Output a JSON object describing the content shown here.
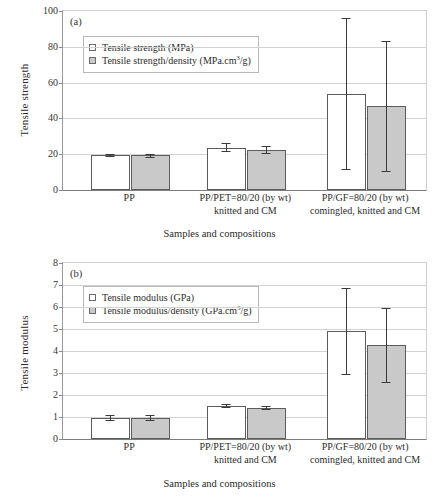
{
  "figure": {
    "xlabel": "Samples and compositions",
    "categories": [
      {
        "line1": "PP",
        "line2": ""
      },
      {
        "line1": "PP/PET=80/20 (by wt)",
        "line2": "knitted and CM"
      },
      {
        "line1": "PP/GF=80/20 (by wt)",
        "line2": "comingled, knitted and CM"
      }
    ],
    "colors": {
      "bar_open": "#ffffff",
      "bar_fill": "#c9c9c9",
      "outline": "#5c5c5c",
      "grid": "#d2d2d2"
    }
  },
  "chart_data": [
    {
      "type": "bar",
      "panel": "(a)",
      "title": "",
      "xlabel": "Samples and compositions",
      "ylabel": "Tensile strength",
      "ylim": [
        0,
        100
      ],
      "yticks": [
        0,
        20,
        40,
        60,
        80,
        100
      ],
      "grid": true,
      "legend_position": "upper left",
      "categories": [
        "PP",
        "PP/PET=80/20 (by wt) knitted and CM",
        "PP/GF=80/20 (by wt) comingled, knitted and CM"
      ],
      "series": [
        {
          "name": "Tensile strength (MPa)",
          "style": "open",
          "values": [
            19.5,
            23.6,
            53.5
          ],
          "err_low": [
            19.0,
            21.6,
            12.0
          ],
          "err_high": [
            20.0,
            26.3,
            96.0
          ]
        },
        {
          "name": "Tensile strength/density (MPa.cm3/g)",
          "style": "filled",
          "values": [
            19.5,
            22.5,
            47.0
          ],
          "err_low": [
            18.7,
            20.6,
            10.5
          ],
          "err_high": [
            20.3,
            24.4,
            83.0
          ]
        }
      ]
    },
    {
      "type": "bar",
      "panel": "(b)",
      "title": "",
      "xlabel": "Samples and compositions",
      "ylabel": "Tensile modulus",
      "ylim": [
        0,
        8
      ],
      "yticks": [
        0,
        1,
        2,
        3,
        4,
        5,
        6,
        7,
        8
      ],
      "grid": true,
      "legend_position": "upper left",
      "categories": [
        "PP",
        "PP/PET=80/20 (by wt) knitted and CM",
        "PP/GF=80/20 (by wt) comingled, knitted and CM"
      ],
      "series": [
        {
          "name": "Tensile modulus (GPa)",
          "style": "open",
          "values": [
            0.97,
            1.5,
            4.9
          ],
          "err_low": [
            0.88,
            1.44,
            2.95
          ],
          "err_high": [
            1.08,
            1.57,
            6.85
          ]
        },
        {
          "name": "Tensile modulus/density (GPa.cm3/g)",
          "style": "filled",
          "values": [
            0.97,
            1.42,
            4.27
          ],
          "err_low": [
            0.85,
            1.35,
            2.6
          ],
          "err_high": [
            1.1,
            1.49,
            5.95
          ]
        }
      ]
    }
  ],
  "legends": {
    "a": [
      {
        "label_pre": "Tensile strength (MPa)",
        "sup": "",
        "label_post": "",
        "style": "open"
      },
      {
        "label_pre": "Tensile strength/density (MPa.cm",
        "sup": "3",
        "label_post": "/g)",
        "style": "filled"
      }
    ],
    "b": [
      {
        "label_pre": "Tensile modulus (GPa)",
        "sup": "",
        "label_post": "",
        "style": "open"
      },
      {
        "label_pre": "Tensile modulus/density (GPa.cm",
        "sup": "3",
        "label_post": "/g)",
        "style": "filled"
      }
    ]
  }
}
